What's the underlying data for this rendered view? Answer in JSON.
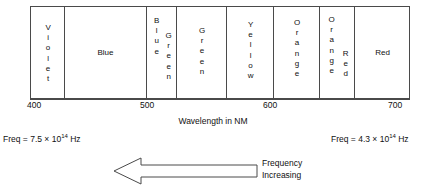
{
  "figure": {
    "axis_title": "Wavelength in NM",
    "axis": {
      "ticks": [
        {
          "value": "400",
          "x": 30
        },
        {
          "value": "500",
          "x": 153
        },
        {
          "value": "600",
          "x": 276
        },
        {
          "value": "700",
          "x": 399
        }
      ],
      "min": 400,
      "max": 700,
      "unit": "NM"
    },
    "bands": [
      {
        "name": "violet",
        "label": "Violet",
        "orientation": "vertical",
        "left": 0,
        "width": 34
      },
      {
        "name": "blue",
        "label": "Blue",
        "orientation": "horizontal",
        "left": 34,
        "width": 82
      },
      {
        "name": "blue-green",
        "label": "Blue",
        "label2": "Green",
        "orientation": "vertical-pair",
        "left": 116,
        "width": 30
      },
      {
        "name": "green",
        "label": "Green",
        "orientation": "vertical",
        "left": 146,
        "width": 50
      },
      {
        "name": "yellow",
        "label": "Yellow",
        "orientation": "vertical",
        "left": 196,
        "width": 47
      },
      {
        "name": "orange",
        "label": "Orange",
        "orientation": "vertical",
        "left": 243,
        "width": 46
      },
      {
        "name": "orange-red",
        "label": "Orange",
        "label2": "Red",
        "orientation": "vertical-pair",
        "left": 289,
        "width": 35
      },
      {
        "name": "red",
        "label": "Red",
        "orientation": "horizontal",
        "left": 324,
        "width": 55
      }
    ],
    "frequency_left": {
      "text": "Freq = 7.5 × 10",
      "exponent": "14",
      "unit": " Hz"
    },
    "frequency_right": {
      "text": "Freq = 4.3 × 10",
      "exponent": "14",
      "unit": " Hz"
    },
    "arrow": {
      "direction": "left",
      "caption_line1": "Frequency",
      "caption_line2": "Increasing"
    },
    "colors": {
      "stroke": "#4a4a4a",
      "text": "#111111",
      "background": "#ffffff"
    }
  }
}
